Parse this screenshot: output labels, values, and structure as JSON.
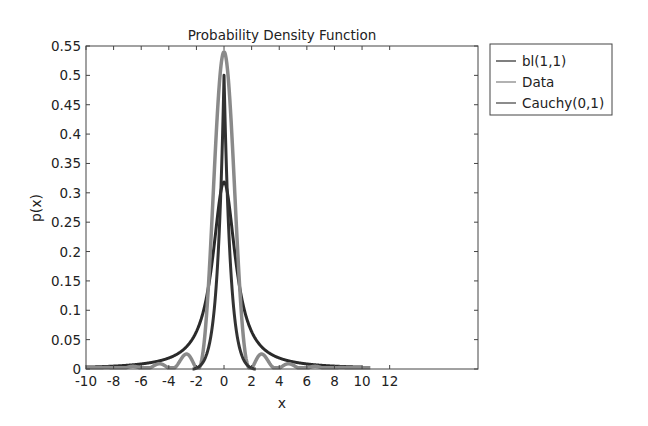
{
  "chart_data": {
    "type": "line",
    "title": "Probability Density Function",
    "xlabel": "x",
    "ylabel": "p(x)",
    "xlim": [
      -10,
      18.4
    ],
    "ylim": [
      0,
      0.55
    ],
    "x_ticks": [
      -10,
      -8,
      -6,
      -4,
      -2,
      0,
      2,
      4,
      6,
      8,
      10,
      12
    ],
    "x_tick_labels": [
      "-10",
      "-8",
      "-6",
      "-4",
      "-2",
      "0",
      "2",
      "4",
      "6",
      "8",
      "10",
      "12"
    ],
    "y_ticks": [
      0,
      0.05,
      0.1,
      0.15,
      0.2,
      0.25,
      0.3,
      0.35,
      0.4,
      0.45,
      0.5,
      0.55
    ],
    "y_tick_labels": [
      "0",
      "0.05",
      "0.1",
      "0.15",
      "0.2",
      "0.25",
      "0.3",
      "0.35",
      "0.4",
      "0.45",
      "0.5",
      "0.55"
    ],
    "grid": false,
    "legend_position": "outside-top-right",
    "series": [
      {
        "name": "bl(1,1)",
        "color": "#333333",
        "description": "narrow peaked density, peak ~0.50 at x=0",
        "x": [
          -10,
          -6,
          -4,
          -3,
          -2,
          -1.5,
          -1,
          -0.6,
          -0.3,
          0,
          0.3,
          0.6,
          1,
          1.5,
          2,
          3,
          4,
          6,
          10
        ],
        "values": [
          0.0,
          0.0,
          0.0,
          0.0,
          0.0,
          0.01,
          0.08,
          0.22,
          0.38,
          0.5,
          0.38,
          0.22,
          0.08,
          0.01,
          0.0,
          0.0,
          0.0,
          0.0,
          0.0
        ]
      },
      {
        "name": "Data",
        "color": "#8a8a8a",
        "description": "sinc-like empirical density with side lobes near +/-2.8",
        "x": [
          -10,
          -8,
          -6,
          -5,
          -4.5,
          -4,
          -3.5,
          -2.8,
          -2.2,
          -1.8,
          -1.2,
          -0.6,
          0,
          0.6,
          1.2,
          1.8,
          2.2,
          2.8,
          3.5,
          4,
          4.5,
          5,
          6,
          8,
          10,
          10.6
        ],
        "values": [
          0.002,
          0.002,
          0.004,
          0.008,
          0.002,
          0.012,
          0.002,
          0.03,
          0.002,
          0.005,
          0.15,
          0.39,
          0.54,
          0.39,
          0.15,
          0.005,
          0.002,
          0.03,
          0.002,
          0.012,
          0.002,
          0.008,
          0.004,
          0.002,
          0.002,
          0.004
        ]
      },
      {
        "name": "Cauchy(0,1)",
        "color": "#2a2a2a",
        "description": "Cauchy density 1/(pi(1+x^2)), peak 0.318 at x=0",
        "x": [
          -10,
          -8,
          -6,
          -4,
          -3,
          -2,
          -1.5,
          -1,
          -0.5,
          0,
          0.5,
          1,
          1.5,
          2,
          3,
          4,
          6,
          8,
          10
        ],
        "values": [
          0.0032,
          0.0049,
          0.0086,
          0.0187,
          0.0318,
          0.0637,
          0.0979,
          0.1592,
          0.2546,
          0.3183,
          0.2546,
          0.1592,
          0.0979,
          0.0637,
          0.0318,
          0.0187,
          0.0086,
          0.0049,
          0.0032
        ]
      }
    ]
  },
  "legend": {
    "items": [
      {
        "label": "bl(1,1)",
        "color": "#555555"
      },
      {
        "label": "Data",
        "color": "#999999"
      },
      {
        "label": "Cauchy(0,1)",
        "color": "#666666"
      }
    ]
  }
}
